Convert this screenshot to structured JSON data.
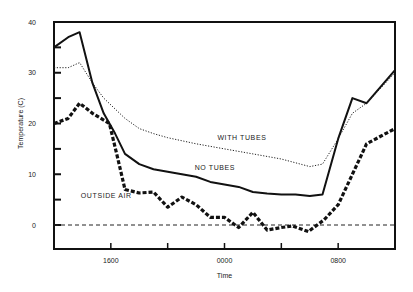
{
  "chart_data": {
    "type": "line",
    "title": "",
    "xlabel": "Time",
    "ylabel": "Temperature (C)",
    "ylim": [
      -5,
      40
    ],
    "xlim_hours_from_1200": [
      0,
      24
    ],
    "x_tick_labels": [
      {
        "hour": 4,
        "label": "1600"
      },
      {
        "hour": 12,
        "label": "0000"
      },
      {
        "hour": 20,
        "label": "0800"
      }
    ],
    "x_minor_ticks_hours": [
      4,
      8,
      12,
      16,
      20
    ],
    "y_tick_labels": [
      "0",
      "10",
      "20",
      "30",
      "40"
    ],
    "y_minor_ticks": [
      5,
      15,
      25,
      35
    ],
    "grid": false,
    "reference_line": {
      "y": 0,
      "style": "dashed"
    },
    "series": [
      {
        "name": "NO TUBES",
        "style": "solid",
        "points": [
          [
            0,
            35
          ],
          [
            1,
            37
          ],
          [
            1.8,
            38
          ],
          [
            2.7,
            28
          ],
          [
            3.5,
            22
          ],
          [
            4.3,
            18
          ],
          [
            5,
            14
          ],
          [
            6,
            12
          ],
          [
            7,
            11
          ],
          [
            8,
            10.5
          ],
          [
            9,
            10
          ],
          [
            10,
            9.5
          ],
          [
            11,
            8.5
          ],
          [
            12,
            8
          ],
          [
            13,
            7.5
          ],
          [
            14,
            6.5
          ],
          [
            15,
            6.2
          ],
          [
            16,
            6
          ],
          [
            17,
            6
          ],
          [
            18,
            5.7
          ],
          [
            18.9,
            6
          ],
          [
            20,
            17
          ],
          [
            21,
            25
          ],
          [
            22,
            24
          ],
          [
            24,
            30.5
          ]
        ]
      },
      {
        "name": "WITH TUBES",
        "style": "dotted",
        "points": [
          [
            0,
            31
          ],
          [
            1,
            31
          ],
          [
            1.8,
            32
          ],
          [
            2.7,
            28
          ],
          [
            3.5,
            25
          ],
          [
            5,
            21
          ],
          [
            6,
            19
          ],
          [
            7,
            18
          ],
          [
            8,
            17.2
          ],
          [
            10,
            16
          ],
          [
            12,
            15
          ],
          [
            14,
            14
          ],
          [
            16,
            13
          ],
          [
            18,
            11.5
          ],
          [
            18.9,
            12
          ],
          [
            20,
            17
          ],
          [
            21,
            22
          ],
          [
            22,
            24
          ],
          [
            24,
            30
          ]
        ]
      },
      {
        "name": "OUTSIDE AIR",
        "style": "heavy-dashed",
        "points": [
          [
            0,
            20
          ],
          [
            1,
            21
          ],
          [
            1.8,
            24
          ],
          [
            2.7,
            22
          ],
          [
            3.9,
            20
          ],
          [
            4.5,
            13
          ],
          [
            5,
            7
          ],
          [
            6,
            6.3
          ],
          [
            7,
            6.5
          ],
          [
            8,
            3.5
          ],
          [
            9,
            5.5
          ],
          [
            10,
            4
          ],
          [
            11,
            1.5
          ],
          [
            12,
            1.5
          ],
          [
            13,
            -0.5
          ],
          [
            14,
            2.5
          ],
          [
            15,
            -1
          ],
          [
            16,
            -0.5
          ],
          [
            16.8,
            -0.2
          ],
          [
            17.9,
            -1.3
          ],
          [
            19,
            1
          ],
          [
            20,
            4
          ],
          [
            21,
            10
          ],
          [
            22,
            16
          ],
          [
            24,
            19
          ]
        ]
      }
    ],
    "annotations": [
      {
        "text": "WITH TUBES",
        "x_hour": 11.5,
        "y": 16.8
      },
      {
        "text": "NO TUBES",
        "x_hour": 9.9,
        "y": 10.9
      },
      {
        "text": "OUTSIDE AIR",
        "x_hour": 0.2,
        "y": 5.3
      }
    ]
  }
}
